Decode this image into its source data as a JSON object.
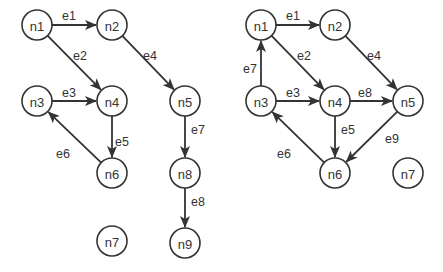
{
  "graphs": [
    {
      "name": "left-graph",
      "radius": 15,
      "nodes": [
        {
          "id": "n1",
          "label": "n1",
          "x": 37,
          "y": 25
        },
        {
          "id": "n2",
          "label": "n2",
          "x": 112,
          "y": 25
        },
        {
          "id": "n3",
          "label": "n3",
          "x": 37,
          "y": 101
        },
        {
          "id": "n4",
          "label": "n4",
          "x": 112,
          "y": 101
        },
        {
          "id": "n5",
          "label": "n5",
          "x": 185,
          "y": 101
        },
        {
          "id": "n6",
          "label": "n6",
          "x": 112,
          "y": 173
        },
        {
          "id": "n8",
          "label": "n8",
          "x": 185,
          "y": 173
        },
        {
          "id": "n7",
          "label": "n7",
          "x": 112,
          "y": 241
        },
        {
          "id": "n9",
          "label": "n9",
          "x": 185,
          "y": 243
        }
      ],
      "edges": [
        {
          "label": "e1",
          "from": "n1",
          "to": "n2",
          "lx": 62,
          "ly": 20
        },
        {
          "label": "e2",
          "from": "n1",
          "to": "n4",
          "lx": 73,
          "ly": 60
        },
        {
          "label": "e3",
          "from": "n3",
          "to": "n4",
          "lx": 62,
          "ly": 97
        },
        {
          "label": "e4",
          "from": "n2",
          "to": "n5",
          "lx": 143,
          "ly": 60
        },
        {
          "label": "e5",
          "from": "n4",
          "to": "n6",
          "lx": 115,
          "ly": 146
        },
        {
          "label": "e6",
          "from": "n6",
          "to": "n3",
          "lx": 56,
          "ly": 158
        },
        {
          "label": "e7",
          "from": "n5",
          "to": "n8",
          "lx": 191,
          "ly": 134
        },
        {
          "label": "e8",
          "from": "n8",
          "to": "n9",
          "lx": 191,
          "ly": 206
        }
      ]
    },
    {
      "name": "right-graph",
      "radius": 15,
      "nodes": [
        {
          "id": "n1",
          "label": "n1",
          "x": 261,
          "y": 25
        },
        {
          "id": "n2",
          "label": "n2",
          "x": 335,
          "y": 25
        },
        {
          "id": "n3",
          "label": "n3",
          "x": 261,
          "y": 101
        },
        {
          "id": "n4",
          "label": "n4",
          "x": 335,
          "y": 101
        },
        {
          "id": "n5",
          "label": "n5",
          "x": 408,
          "y": 101
        },
        {
          "id": "n6",
          "label": "n6",
          "x": 335,
          "y": 173
        },
        {
          "id": "n7",
          "label": "n7",
          "x": 408,
          "y": 173
        }
      ],
      "edges": [
        {
          "label": "e1",
          "from": "n1",
          "to": "n2",
          "lx": 286,
          "ly": 20
        },
        {
          "label": "e2",
          "from": "n1",
          "to": "n4",
          "lx": 297,
          "ly": 60
        },
        {
          "label": "e3",
          "from": "n3",
          "to": "n4",
          "lx": 286,
          "ly": 97
        },
        {
          "label": "e4",
          "from": "n2",
          "to": "n5",
          "lx": 367,
          "ly": 60
        },
        {
          "label": "e5",
          "from": "n4",
          "to": "n6",
          "lx": 341,
          "ly": 134
        },
        {
          "label": "e6",
          "from": "n6",
          "to": "n3",
          "lx": 277,
          "ly": 158
        },
        {
          "label": "e7",
          "from": "n3",
          "to": "n1",
          "lx": 243,
          "ly": 73
        },
        {
          "label": "e8",
          "from": "n4",
          "to": "n5",
          "lx": 358,
          "ly": 97
        },
        {
          "label": "e9",
          "from": "n5",
          "to": "n6",
          "lx": 385,
          "ly": 143
        }
      ]
    }
  ]
}
